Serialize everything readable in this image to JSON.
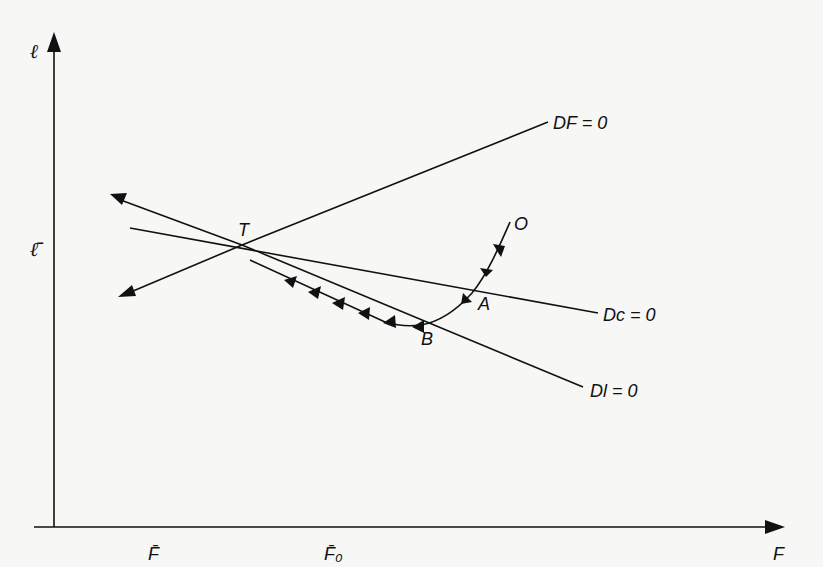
{
  "diagram": {
    "type": "phase-diagram",
    "axes": {
      "x": {
        "label": "F",
        "ticks": [
          "F̄",
          "F̄₀"
        ]
      },
      "y": {
        "label": "ℓ",
        "ticks": [
          "ℓ̄"
        ]
      }
    },
    "points": {
      "T": "T",
      "O": "O",
      "A": "A",
      "B": "B"
    },
    "curves": {
      "df": "DF = 0",
      "dc": "Dc = 0",
      "dl": "Dl = 0"
    },
    "colors": {
      "ink": "#111111",
      "background": "#f7f7f5"
    }
  }
}
